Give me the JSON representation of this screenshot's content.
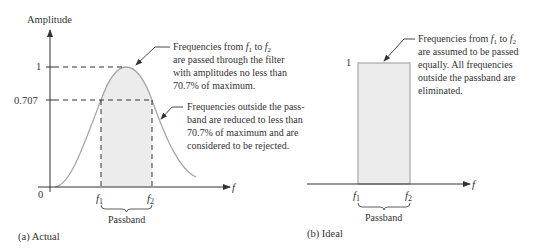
{
  "panel_a": {
    "y_axis_label": "Amplitude",
    "x_axis_label": "f",
    "tick_1": "1",
    "tick_0707": "0.707",
    "origin": "0",
    "f1": "f",
    "f1_sub": "1",
    "f2": "f",
    "f2_sub": "2",
    "passband": "Passband",
    "caption": "(a)  Actual",
    "note1": {
      "line1_pre": "Frequencies from ",
      "line1_f1": "f",
      "line1_s1": "1",
      "line1_mid": " to ",
      "line1_f2": "f",
      "line1_s2": "2",
      "line2": "are passed through the filter",
      "line3": "with amplitudes no less than",
      "line4": "70.7% of maximum."
    },
    "note2": {
      "line1": "Frequencies outside the pass-",
      "line2": "band are reduced to less than",
      "line3": "70.7% of maximum and are",
      "line4": "considered to be rejected."
    }
  },
  "panel_b": {
    "x_axis_label": "f",
    "tick_1": "1",
    "f1": "f",
    "f1_sub": "1",
    "f2": "f",
    "f2_sub": "2",
    "passband": "Passband",
    "caption": "(b)  Ideal",
    "note": {
      "line1_pre": "Frequencies from ",
      "line1_f1": "f",
      "line1_s1": "1",
      "line1_mid": " to ",
      "line1_f2": "f",
      "line1_s2": "2",
      "line2": "are assumed to be passed",
      "line3": "equally. All frequencies",
      "line4": "outside the passband are",
      "line5": "eliminated."
    }
  },
  "colors": {
    "fill": "#ececec",
    "curve": "#a8a8a8",
    "axis": "#333333"
  }
}
